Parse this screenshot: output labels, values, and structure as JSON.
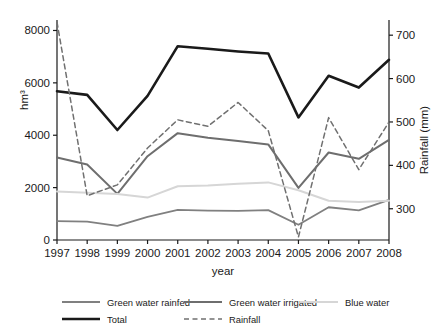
{
  "chart_data": {
    "type": "line",
    "title": "",
    "xlabel": "year",
    "ylabel": "hm³",
    "y2label": "Rainfall (mm)",
    "categories": [
      1997,
      1998,
      1999,
      2000,
      2001,
      2002,
      2003,
      2004,
      2005,
      2006,
      2007,
      2008
    ],
    "x_tick_labels": [
      "1997",
      "1998",
      "1999",
      "2000",
      "2001",
      "2002",
      "2003",
      "2004",
      "2005",
      "2006",
      "2007",
      "2008"
    ],
    "ylim": [
      0,
      8400
    ],
    "y_ticks": [
      0,
      2000,
      4000,
      6000,
      8000
    ],
    "y_tick_labels": [
      "0",
      "2000",
      "4000",
      "6000",
      "8000"
    ],
    "y2lim": [
      228,
      735
    ],
    "y2_ticks": [
      300,
      400,
      500,
      600,
      700
    ],
    "y2_tick_labels": [
      "300",
      "400",
      "500",
      "600",
      "700"
    ],
    "grid": false,
    "legend_position": "bottom",
    "series": [
      {
        "name": "Green water rainfed",
        "axis": "left",
        "color": "#808080",
        "style": "solid",
        "width": 1.8,
        "values": [
          720,
          700,
          540,
          880,
          1150,
          1120,
          1110,
          1140,
          580,
          1250,
          1130,
          1530
        ]
      },
      {
        "name": "Green water irrigated",
        "axis": "left",
        "color": "#6e6e6e",
        "style": "solid",
        "width": 2.0,
        "values": [
          3150,
          2880,
          1760,
          3200,
          4080,
          3900,
          3780,
          3650,
          1990,
          3340,
          3100,
          3820
        ]
      },
      {
        "name": "Blue water",
        "axis": "left",
        "color": "#d6d6d6",
        "style": "solid",
        "width": 2.0,
        "values": [
          1850,
          1800,
          1760,
          1620,
          2050,
          2080,
          2150,
          2200,
          1900,
          1500,
          1450,
          1500
        ]
      },
      {
        "name": "Total",
        "axis": "left",
        "color": "#1a1a1a",
        "style": "solid",
        "width": 2.6,
        "values": [
          5680,
          5540,
          4200,
          5500,
          7400,
          7300,
          7200,
          7120,
          4680,
          6270,
          5820,
          6880
        ]
      },
      {
        "name": "Rainfall",
        "axis": "right",
        "color": "#707070",
        "style": "dashed",
        "width": 1.5,
        "values": [
          730,
          330,
          355,
          440,
          505,
          490,
          545,
          480,
          235,
          510,
          390,
          500
        ]
      }
    ]
  },
  "legend": {
    "items": [
      {
        "label": "Green water rainfed"
      },
      {
        "label": "Green water irrigated"
      },
      {
        "label": "Blue water"
      },
      {
        "label": "Total"
      },
      {
        "label": "Rainfall"
      }
    ]
  },
  "axes": {
    "x_title": "year",
    "y_left_title": "hm³",
    "y_right_title": "Rainfall (mm)"
  }
}
